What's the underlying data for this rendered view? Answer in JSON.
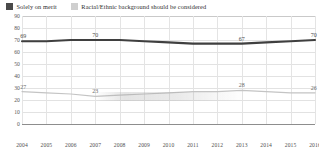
{
  "legend": {
    "position": "top-left",
    "items": [
      {
        "label": "Solely on merit",
        "color": "#4a4a4a",
        "swatch": "dark-square-icon"
      },
      {
        "label": "Racial/Ethnic background should be considered",
        "color": "#cfcfcf",
        "swatch": "light-square-icon"
      }
    ]
  },
  "chart_data": {
    "type": "line",
    "title": "",
    "subtitle": "",
    "xlabel": "",
    "ylabel": "",
    "x": [
      2004,
      2005,
      2006,
      2007,
      2008,
      2009,
      2010,
      2011,
      2012,
      2013,
      2014,
      2015,
      2016
    ],
    "categories": [
      "2004",
      "2005",
      "2006",
      "2007",
      "2008",
      "2009",
      "2010",
      "2011",
      "2012",
      "2013",
      "2014",
      "2015",
      "2016"
    ],
    "ylim": [
      0,
      90
    ],
    "yticks": [
      0,
      10,
      20,
      30,
      40,
      50,
      60,
      70,
      80,
      90
    ],
    "grid": true,
    "legend_position": "top-left",
    "series": [
      {
        "name": "Solely on merit",
        "color": "#3f3f3f",
        "values": [
          69,
          69,
          70,
          70,
          70,
          69,
          68,
          67,
          67,
          67,
          68,
          69,
          70
        ],
        "labels": [
          {
            "x": 2004,
            "value": 69,
            "text": "69"
          },
          {
            "x": 2007,
            "value": 70,
            "text": "70"
          },
          {
            "x": 2013,
            "value": 67,
            "text": "67"
          },
          {
            "x": 2016,
            "value": 70,
            "text": "70"
          }
        ]
      },
      {
        "name": "Racial/Ethnic background should be considered",
        "color": "#c4c4c4",
        "values": [
          27,
          26,
          25,
          23,
          24,
          25,
          26,
          27,
          27,
          28,
          27,
          26,
          26
        ],
        "labels": [
          {
            "x": 2004,
            "value": 27,
            "text": "27"
          },
          {
            "x": 2007,
            "value": 23,
            "text": "23"
          },
          {
            "x": 2013,
            "value": 28,
            "text": "28"
          },
          {
            "x": 2016,
            "value": 26,
            "text": "26"
          }
        ]
      }
    ]
  }
}
